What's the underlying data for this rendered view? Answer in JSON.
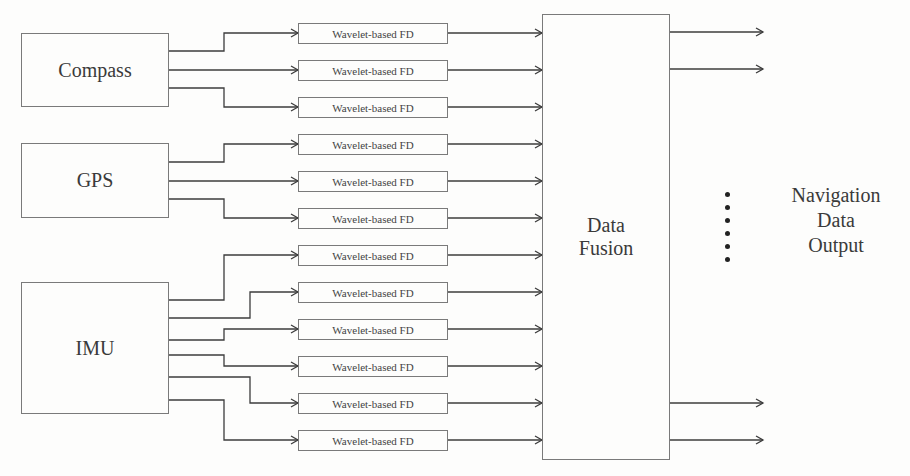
{
  "diagram": {
    "sources": [
      {
        "id": "compass",
        "label": "Compass"
      },
      {
        "id": "gps",
        "label": "GPS"
      },
      {
        "id": "imu",
        "label": "IMU"
      }
    ],
    "fd_blocks": [
      {
        "label": "Wavelet-based FD",
        "source": "compass"
      },
      {
        "label": "Wavelet-based FD",
        "source": "compass"
      },
      {
        "label": "Wavelet-based FD",
        "source": "compass"
      },
      {
        "label": "Wavelet-based FD",
        "source": "gps"
      },
      {
        "label": "Wavelet-based FD",
        "source": "gps"
      },
      {
        "label": "Wavelet-based FD",
        "source": "gps"
      },
      {
        "label": "Wavelet-based FD",
        "source": "imu"
      },
      {
        "label": "Wavelet-based FD",
        "source": "imu"
      },
      {
        "label": "Wavelet-based FD",
        "source": "imu"
      },
      {
        "label": "Wavelet-based FD",
        "source": "imu"
      },
      {
        "label": "Wavelet-based FD",
        "source": "imu"
      },
      {
        "label": "Wavelet-based FD",
        "source": "imu"
      }
    ],
    "fusion": {
      "line1": "Data",
      "line2": "Fusion"
    },
    "output": {
      "line1": "Navigation",
      "line2": "Data",
      "line3": "Output"
    },
    "colors": {
      "line": "#3c3c3c",
      "box_border": "#7a7a7a",
      "text": "#3a3a3a"
    }
  }
}
